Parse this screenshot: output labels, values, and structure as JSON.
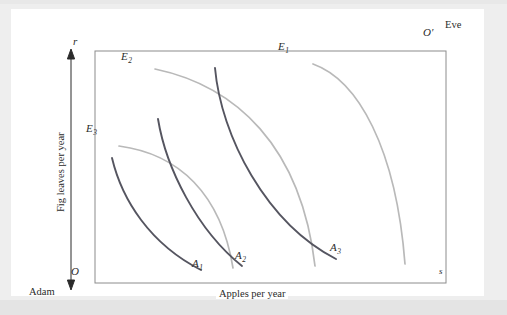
{
  "figure": {
    "type": "edgeworth-box",
    "background_color": "#eeeeee",
    "panel_color": "#ffffff",
    "box_border_color": "#8c8c8c",
    "adam_curve_color": "#555560",
    "eve_curve_color": "#b9b9b9",
    "axis_color": "#2b2b2b"
  },
  "origins": {
    "adam_origin": "O",
    "eve_origin": "O′",
    "adam_name": "Adam",
    "eve_name": "Eve",
    "vertical_tick": "r",
    "horizontal_tick": "s"
  },
  "axes": {
    "x_label": "Apples per year",
    "y_label": "Fig leaves per year"
  },
  "curves": {
    "adam": [
      {
        "label": "A",
        "subscript": "1"
      },
      {
        "label": "A",
        "subscript": "2"
      },
      {
        "label": "A",
        "subscript": "3"
      }
    ],
    "eve": [
      {
        "label": "E",
        "subscript": "1"
      },
      {
        "label": "E",
        "subscript": "2"
      },
      {
        "label": "E",
        "subscript": "3"
      }
    ]
  },
  "chart_data": {
    "type": "line",
    "title": "",
    "xlabel": "Apples per year",
    "ylabel": "Fig leaves per year",
    "grid": false,
    "legend": "none",
    "box": {
      "x0": 73,
      "y0": 265,
      "x1": 424,
      "y1": 33
    },
    "series": [
      {
        "name": "A1",
        "owner": "Adam",
        "color": "#555560",
        "path": "M 90,140 C 100,182 128,226 179,252"
      },
      {
        "name": "A2",
        "owner": "Adam",
        "color": "#555560",
        "path": "M 136,101 C 144,150 175,212 220,248"
      },
      {
        "name": "A3",
        "owner": "Adam",
        "color": "#555560",
        "path": "M 193,50 C 199,118 244,205 314,241"
      },
      {
        "name": "E1",
        "owner": "Eve",
        "color": "#b9b9b9",
        "path": "M 291,46 C 336,62 374,130 383,246"
      },
      {
        "name": "E2",
        "owner": "Eve",
        "color": "#b9b9b9",
        "path": "M 133,51 C 214,68 279,128 293,248"
      },
      {
        "name": "E3",
        "owner": "Eve",
        "color": "#b9b9b9",
        "path": "M 97,128 C 157,136 199,176 211,250"
      }
    ]
  }
}
